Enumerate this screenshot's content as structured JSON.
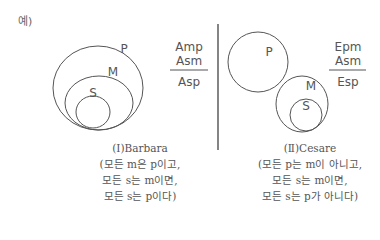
{
  "example_label": "예)",
  "diagrams": [
    {
      "id": "barbara",
      "circles": {
        "outer": "P",
        "middle": "M",
        "inner": "S"
      },
      "premises": [
        "Amp",
        "Asm"
      ],
      "conclusion": "Asp",
      "caption": {
        "title": "(Ⅰ)Barbara",
        "lines": [
          "(모든 m은 p이고,",
          "모든 s는 m이면,",
          "모든 s는 p이다)"
        ]
      }
    },
    {
      "id": "cesare",
      "circles": {
        "separate": "P",
        "middle": "M",
        "inner": "S"
      },
      "premises": [
        "Epm",
        "Asm"
      ],
      "conclusion": "Esp",
      "caption": {
        "title": "(Ⅱ)Cesare",
        "lines": [
          "(모든 p는 m이 아니고,",
          "모든 s는 m이면,",
          "모든 s는 p가 아니다)"
        ]
      }
    }
  ],
  "colors": {
    "stroke": "#555555",
    "text": "#555555",
    "divider": "#333333"
  }
}
